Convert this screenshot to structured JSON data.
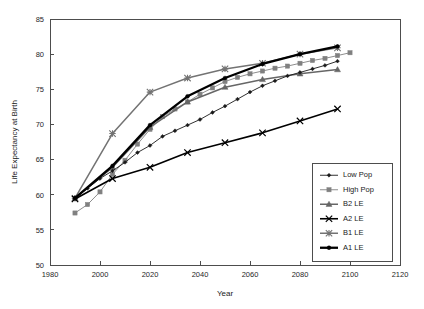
{
  "chart_data": {
    "type": "line",
    "title": "",
    "xlabel": "Year",
    "ylabel": "Life Expectancy at Birth",
    "xlim": [
      1980,
      2120
    ],
    "ylim": [
      50,
      85
    ],
    "xticks": [
      1980,
      2000,
      2020,
      2040,
      2060,
      2080,
      2100,
      2120
    ],
    "yticks": [
      50,
      55,
      60,
      65,
      70,
      75,
      80,
      85
    ],
    "grid": false,
    "legend_position": "lower-right-inside",
    "series": [
      {
        "name": "Low Pop",
        "color": "#1a1a1a",
        "marker": "diamond",
        "line_width": 0.9,
        "x": [
          1990,
          1995,
          2000,
          2005,
          2010,
          2015,
          2020,
          2025,
          2030,
          2035,
          2040,
          2045,
          2050,
          2055,
          2060,
          2065,
          2070,
          2075,
          2080,
          2085,
          2090,
          2095
        ],
        "y": [
          59.5,
          60.9,
          62.3,
          63.4,
          64.6,
          66.0,
          67.0,
          68.3,
          69.1,
          69.9,
          70.7,
          71.7,
          72.6,
          73.6,
          74.6,
          75.5,
          76.2,
          76.9,
          77.4,
          77.9,
          78.4,
          79.0
        ]
      },
      {
        "name": "High Pop",
        "color": "#808080",
        "marker": "square",
        "line_width": 0.9,
        "x": [
          1990,
          1995,
          2000,
          2005,
          2010,
          2015,
          2020,
          2025,
          2030,
          2035,
          2040,
          2045,
          2050,
          2055,
          2060,
          2065,
          2070,
          2075,
          2080,
          2085,
          2090,
          2095,
          2100
        ],
        "y": [
          57.4,
          58.6,
          60.4,
          62.9,
          64.9,
          67.2,
          69.3,
          71.1,
          72.2,
          73.2,
          74.3,
          75.2,
          76.1,
          76.7,
          77.2,
          77.6,
          78.0,
          78.3,
          78.7,
          79.1,
          79.4,
          79.8,
          80.2
        ]
      },
      {
        "name": "B2 LE",
        "color": "#666666",
        "marker": "triangle",
        "line_width": 1.5,
        "x": [
          1990,
          2005,
          2020,
          2035,
          2050,
          2065,
          2080,
          2095
        ],
        "y": [
          59.5,
          63.9,
          69.6,
          73.2,
          75.3,
          76.4,
          77.2,
          77.8
        ]
      },
      {
        "name": "A2 LE",
        "color": "#000000",
        "marker": "cross",
        "line_width": 1.6,
        "x": [
          1990,
          2005,
          2020,
          2035,
          2050,
          2065,
          2080,
          2095
        ],
        "y": [
          59.4,
          62.3,
          63.9,
          66.0,
          67.4,
          68.8,
          70.5,
          72.2
        ]
      },
      {
        "name": "B1 LE",
        "color": "#737373",
        "marker": "star",
        "line_width": 1.5,
        "x": [
          1990,
          2005,
          2020,
          2035,
          2050,
          2065,
          2080,
          2095
        ],
        "y": [
          59.5,
          68.7,
          74.6,
          76.6,
          77.9,
          78.7,
          80.0,
          80.9
        ]
      },
      {
        "name": "A1 LE",
        "color": "#000000",
        "marker": "dot",
        "line_width": 2.3,
        "x": [
          1990,
          2005,
          2020,
          2035,
          2050,
          2065,
          2080,
          2095
        ],
        "y": [
          59.5,
          64.1,
          69.9,
          74.0,
          76.6,
          78.6,
          80.0,
          81.1
        ]
      }
    ]
  },
  "legend": {
    "items": [
      {
        "label": "Low Pop"
      },
      {
        "label": "High Pop"
      },
      {
        "label": "B2 LE"
      },
      {
        "label": "A2 LE"
      },
      {
        "label": "B1 LE"
      },
      {
        "label": "A1 LE"
      }
    ]
  }
}
